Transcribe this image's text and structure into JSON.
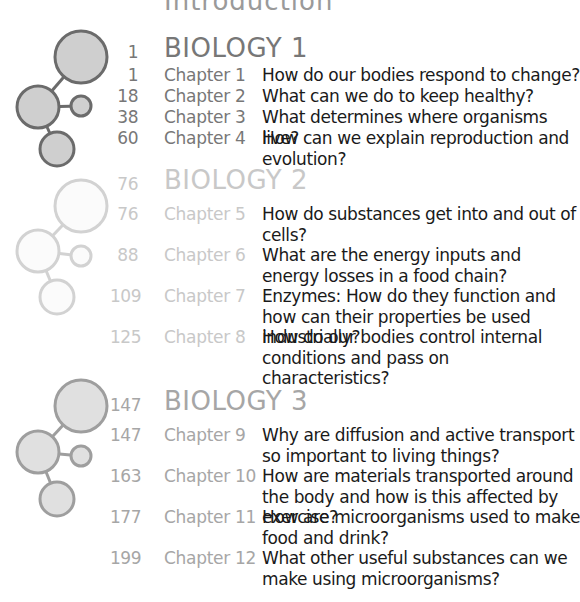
{
  "page": {
    "top_heading": "Introduction",
    "top_heading_page": "iv"
  },
  "sections": [
    {
      "page": "1",
      "title": "BIOLOGY 1",
      "colors": {
        "fill": "#cfcfcf",
        "stroke": "#6b6b6b",
        "text": "#777777"
      },
      "chapters": [
        {
          "page": "1",
          "label": "Chapter 1",
          "description": "How do our bodies respond to change?"
        },
        {
          "page": "18",
          "label": "Chapter 2",
          "description": "What can we do to keep healthy?"
        },
        {
          "page": "38",
          "label": "Chapter 3",
          "description": "What determines where organisms live?"
        },
        {
          "page": "60",
          "label": "Chapter 4",
          "description": "How can we explain reproduction and evolution?"
        }
      ]
    },
    {
      "page": "76",
      "title": "BIOLOGY 2",
      "colors": {
        "fill": "#fbfbfb",
        "stroke": "#d2d2d2",
        "text": "#c8c8c8"
      },
      "chapters": [
        {
          "page": "76",
          "label": "Chapter 5",
          "description": "How do substances get into and out of cells?"
        },
        {
          "page": "88",
          "label": "Chapter 6",
          "description": "What are the energy inputs and energy losses in a food chain?"
        },
        {
          "page": "109",
          "label": "Chapter 7",
          "description": "Enzymes: How do they function and how can their properties be used industrially?"
        },
        {
          "page": "125",
          "label": "Chapter 8",
          "description": "How do our bodies control internal conditions and pass on characteristics?"
        }
      ]
    },
    {
      "page": "147",
      "title": "BIOLOGY 3",
      "colors": {
        "fill": "#e0e0e0",
        "stroke": "#9e9e9e",
        "text": "#a6a6a6"
      },
      "chapters": [
        {
          "page": "147",
          "label": "Chapter 9",
          "description": "Why are diffusion and active transport so important to living things?"
        },
        {
          "page": "163",
          "label": "Chapter 10",
          "description": "How are materials transported around the body and how is this affected by exercise?"
        },
        {
          "page": "177",
          "label": "Chapter 11",
          "description": "How are microorganisms used to make food and drink?"
        },
        {
          "page": "199",
          "label": "Chapter 12",
          "description": "What other useful substances can we make using microorganisms?"
        }
      ]
    }
  ]
}
